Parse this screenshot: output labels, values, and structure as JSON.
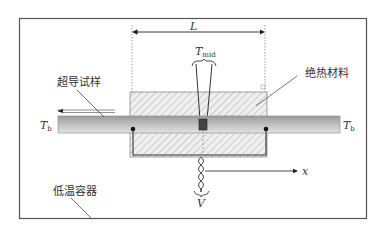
{
  "diagram": {
    "labels": {
      "length": "L",
      "t_mid_main": "T",
      "t_mid_sub": "mid",
      "t_b_main": "T",
      "t_b_sub": "b",
      "voltage": "V",
      "axis_x": "x",
      "sample": "超导试样",
      "insulation": "绝热材料",
      "cryostat": "低温容器"
    },
    "colors": {
      "frame": "#555555",
      "hatch": "#9a9a9a",
      "insulation_fill": "#efefef",
      "bar_dark": "#8c8c8c",
      "bar_light": "#d6d6d6",
      "wire": "#333333"
    }
  }
}
